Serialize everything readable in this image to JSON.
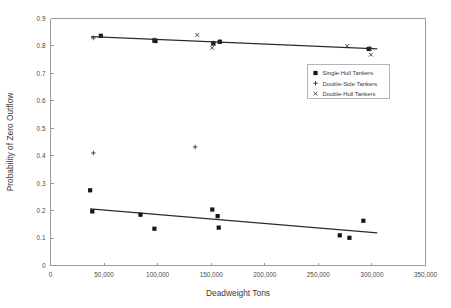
{
  "chart_data": {
    "type": "scatter",
    "title": "",
    "xlabel": "Deadweight Tons",
    "ylabel": "Probability of Zero Outflow",
    "xlim": [
      0,
      350000
    ],
    "ylim": [
      0,
      0.9
    ],
    "xticks": [
      0,
      50000,
      100000,
      150000,
      200000,
      250000,
      300000,
      350000
    ],
    "xticklabels": [
      "0",
      "50,000",
      "100,000",
      "150,000",
      "200,000",
      "250,000",
      "300,000",
      "350,000"
    ],
    "yticks": [
      0,
      0.1,
      0.2,
      0.3,
      0.4,
      0.5,
      0.6,
      0.7,
      0.8,
      0.9
    ],
    "yticklabels": [
      "0",
      "0.1",
      "0.2",
      "0.3",
      "0.4",
      "0.5",
      "0.6",
      "0.7",
      "0.8",
      "0.9"
    ],
    "grid": false,
    "legend_position": "upper right",
    "series": [
      {
        "name": "Single-Hull Tankers",
        "marker": "square",
        "points": [
          [
            37000,
            0.274
          ],
          [
            39000,
            0.197
          ],
          [
            47000,
            0.837
          ],
          [
            84000,
            0.185
          ],
          [
            97000,
            0.134
          ],
          [
            97000,
            0.82
          ],
          [
            98000,
            0.818
          ],
          [
            151000,
            0.204
          ],
          [
            152000,
            0.809
          ],
          [
            156000,
            0.18
          ],
          [
            157000,
            0.138
          ],
          [
            158000,
            0.815
          ],
          [
            270000,
            0.11
          ],
          [
            279000,
            0.101
          ],
          [
            292000,
            0.163
          ],
          [
            297000,
            0.789
          ]
        ]
      },
      {
        "name": "Double-Side Tankers",
        "marker": "plus",
        "points": [
          [
            40000,
            0.41
          ],
          [
            40000,
            0.829
          ],
          [
            97000,
            0.822
          ],
          [
            135000,
            0.432
          ],
          [
            152000,
            0.811
          ],
          [
            158000,
            0.817
          ],
          [
            298000,
            0.792
          ]
        ]
      },
      {
        "name": "Double-Hull Tankers",
        "marker": "x",
        "points": [
          [
            47000,
            0.836
          ],
          [
            97000,
            0.819
          ],
          [
            137000,
            0.84
          ],
          [
            151000,
            0.793
          ],
          [
            152000,
            0.809
          ],
          [
            158000,
            0.815
          ],
          [
            277000,
            0.8
          ],
          [
            298000,
            0.789
          ],
          [
            299000,
            0.768
          ]
        ]
      }
    ],
    "trendlines": [
      {
        "name": "upper-trend",
        "series": "Double-Hull / Double-Side Tankers",
        "x": [
          38000,
          305000
        ],
        "y": [
          0.834,
          0.789
        ]
      },
      {
        "name": "lower-trend",
        "series": "Single-Hull Tankers",
        "x": [
          37000,
          305000
        ],
        "y": [
          0.206,
          0.119
        ]
      }
    ],
    "legend": [
      {
        "label": "Single-Hull Tankers",
        "marker": "square"
      },
      {
        "label": "Double-Side Tankers",
        "marker": "plus"
      },
      {
        "label": "Double-Hull Tankers",
        "marker": "x"
      }
    ]
  }
}
